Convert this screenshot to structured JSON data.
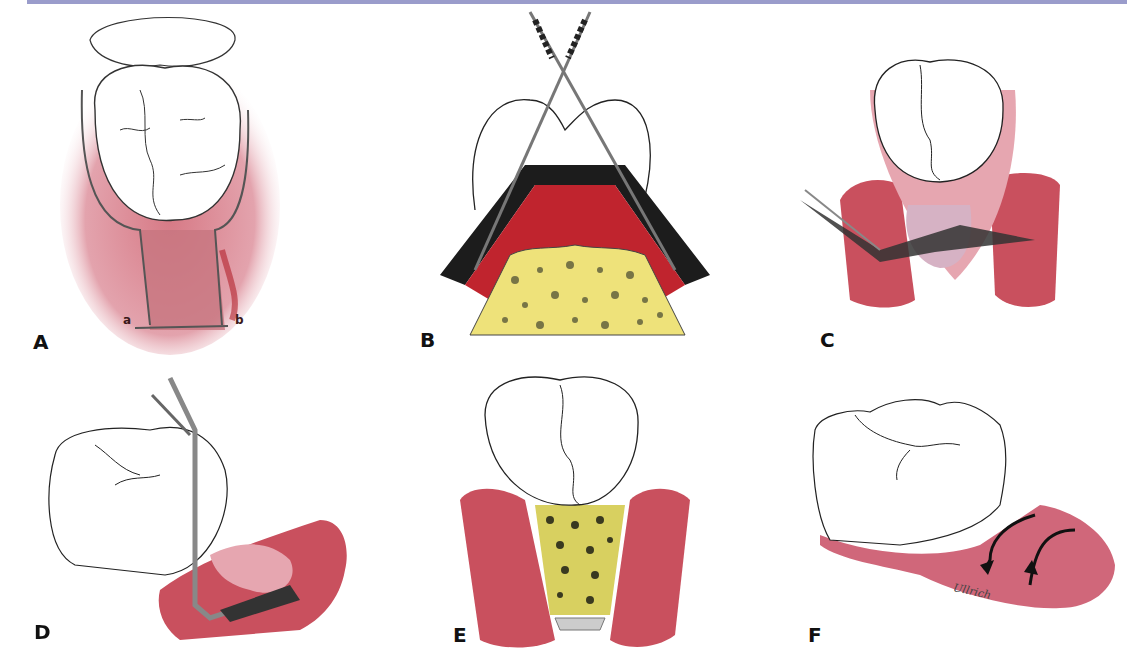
{
  "figure": {
    "top_bar_color": "#9a9ccb",
    "panels": [
      {
        "id": "A",
        "label": "A",
        "sub_labels": [
          "a",
          "b"
        ]
      },
      {
        "id": "B",
        "label": "B"
      },
      {
        "id": "C",
        "label": "C"
      },
      {
        "id": "D",
        "label": "D"
      },
      {
        "id": "E",
        "label": "E"
      },
      {
        "id": "F",
        "label": "F",
        "signature": "Ullrich"
      }
    ],
    "colors": {
      "gingiva": "#c9505e",
      "gingiva_light": "#e6a6b0",
      "tissue_red": "#b81f2a",
      "bone_yellow": "#eee27a",
      "bone_pore": "#5a5a3a",
      "tooth_outline": "#222222",
      "instrument": "#888888"
    }
  }
}
